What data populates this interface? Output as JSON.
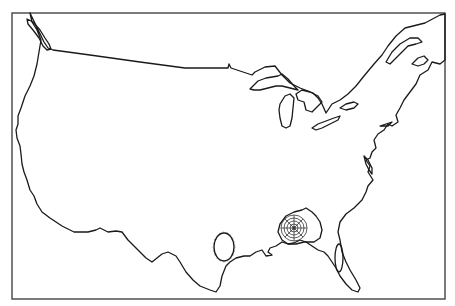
{
  "map": {
    "title": "Outline map of the contiguous United States",
    "frame": {
      "x": 12,
      "y": 13,
      "width": 433,
      "height": 286,
      "stroke": "#444444"
    },
    "line_color": "#1a1a1a",
    "background": "#ffffff",
    "features": [
      {
        "name": "us-coastline-border",
        "label": "Contiguous US outline"
      },
      {
        "name": "great-lakes",
        "label": "Great Lakes"
      },
      {
        "name": "florida-peninsula",
        "label": "Florida"
      },
      {
        "name": "georgia-contour-rings",
        "label": "Concentric contour rings over Georgia"
      },
      {
        "name": "gulf-coast-ellipse",
        "label": "Closed ellipse near Texas/Louisiana coast"
      }
    ]
  }
}
